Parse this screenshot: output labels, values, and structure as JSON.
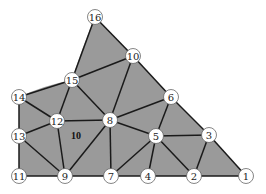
{
  "diagram": {
    "type": "triangular-mesh",
    "fill_color": "#9a9a9a",
    "edge_color": "#1a1a1a",
    "element_label": {
      "text": "10",
      "x": 76,
      "y": 135
    },
    "nodes": [
      {
        "id": "1",
        "x": 246,
        "y": 176
      },
      {
        "id": "2",
        "x": 194,
        "y": 176
      },
      {
        "id": "3",
        "x": 209,
        "y": 135
      },
      {
        "id": "4",
        "x": 148,
        "y": 176
      },
      {
        "id": "5",
        "x": 156,
        "y": 136
      },
      {
        "id": "6",
        "x": 171,
        "y": 97
      },
      {
        "id": "7",
        "x": 111,
        "y": 176
      },
      {
        "id": "8",
        "x": 110,
        "y": 120
      },
      {
        "id": "9",
        "x": 65,
        "y": 176
      },
      {
        "id": "10",
        "x": 133,
        "y": 56
      },
      {
        "id": "11",
        "x": 19,
        "y": 176
      },
      {
        "id": "12",
        "x": 57,
        "y": 121
      },
      {
        "id": "13",
        "x": 19,
        "y": 136
      },
      {
        "id": "14",
        "x": 19,
        "y": 97
      },
      {
        "id": "15",
        "x": 72,
        "y": 80
      },
      {
        "id": "16",
        "x": 95,
        "y": 17
      }
    ],
    "edges": [
      [
        "16",
        "10"
      ],
      [
        "16",
        "15"
      ],
      [
        "15",
        "10"
      ],
      [
        "15",
        "14"
      ],
      [
        "15",
        "12"
      ],
      [
        "15",
        "8"
      ],
      [
        "10",
        "8"
      ],
      [
        "10",
        "6"
      ],
      [
        "6",
        "8"
      ],
      [
        "6",
        "5"
      ],
      [
        "6",
        "3"
      ],
      [
        "8",
        "12"
      ],
      [
        "8",
        "9"
      ],
      [
        "8",
        "7"
      ],
      [
        "8",
        "5"
      ],
      [
        "12",
        "14"
      ],
      [
        "12",
        "13"
      ],
      [
        "12",
        "9"
      ],
      [
        "14",
        "13"
      ],
      [
        "13",
        "11"
      ],
      [
        "13",
        "9"
      ],
      [
        "11",
        "9"
      ],
      [
        "9",
        "7"
      ],
      [
        "7",
        "5"
      ],
      [
        "7",
        "4"
      ],
      [
        "4",
        "5"
      ],
      [
        "4",
        "2"
      ],
      [
        "5",
        "2"
      ],
      [
        "5",
        "3"
      ],
      [
        "3",
        "2"
      ],
      [
        "3",
        "1"
      ],
      [
        "2",
        "1"
      ]
    ],
    "boundary": [
      "1",
      "3",
      "6",
      "10",
      "16",
      "15",
      "14",
      "13",
      "11",
      "9",
      "7",
      "4",
      "2"
    ]
  }
}
